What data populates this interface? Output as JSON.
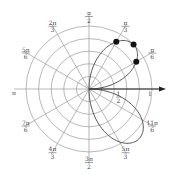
{
  "figure": {
    "type": "polar-plot",
    "center": [
      89,
      89
    ],
    "outer_radius_px": 63,
    "ring_count": 5,
    "colors": {
      "grid": "#9a9a9a",
      "curve": "#555555",
      "axis": "#222222",
      "dot": "#111111",
      "label": "#444444"
    }
  },
  "angle_labels": [
    {
      "id": "0",
      "num": "π",
      "den": "2",
      "angle_deg": 90
    },
    {
      "id": "1",
      "num": "2π",
      "den": "3",
      "angle_deg": 120
    },
    {
      "id": "2",
      "num": "π",
      "den": "3",
      "angle_deg": 60
    },
    {
      "id": "3",
      "num": "5π",
      "den": "6",
      "angle_deg": 150
    },
    {
      "id": "4",
      "num": "π",
      "den": "6",
      "angle_deg": 30
    },
    {
      "id": "5",
      "num": "π",
      "den": "",
      "angle_deg": 180
    },
    {
      "id": "6",
      "num": "7π",
      "den": "6",
      "angle_deg": 210
    },
    {
      "id": "7",
      "num": "11π",
      "den": "6",
      "angle_deg": 330
    },
    {
      "id": "8",
      "num": "4π",
      "den": "3",
      "angle_deg": 240
    },
    {
      "id": "9",
      "num": "5π",
      "den": "3",
      "angle_deg": 300
    },
    {
      "id": "10",
      "num": "3π",
      "den": "2",
      "angle_deg": 270
    }
  ],
  "radial_labels": [
    {
      "num": "1",
      "den": "2",
      "r": 0.5
    },
    {
      "num": "1",
      "den": "",
      "r": 1
    }
  ],
  "chart_data": {
    "type": "line",
    "title": "",
    "coordinate_system": "polar",
    "curve": "r = |sin(2θ)|, θ ∈ [-π/2, π/2] (two lobes: quadrant I and quadrant IV)",
    "theta_ticks": [
      "π/6",
      "π/3",
      "π/2",
      "2π/3",
      "5π/6",
      "π",
      "7π/6",
      "4π/3",
      "3π/2",
      "5π/3",
      "11π/6"
    ],
    "r_ticks": [
      "1/2",
      "1"
    ],
    "highlighted_points": [
      {
        "theta": "π/6",
        "r": 0.87
      },
      {
        "theta": "π/4",
        "r": 1.0
      },
      {
        "theta": "π/3",
        "r": 0.87
      }
    ],
    "grid": true,
    "polar_axis_arrow": true
  }
}
